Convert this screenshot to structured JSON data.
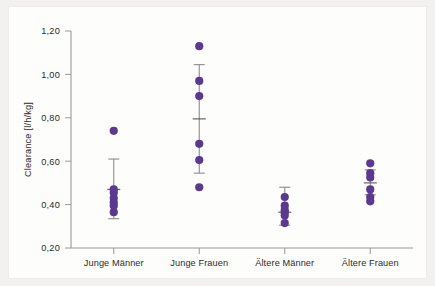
{
  "chart_data": {
    "type": "scatter",
    "title": "",
    "xlabel": "",
    "ylabel": "Clearance [l/h/kg]",
    "ylim": [
      0.2,
      1.2
    ],
    "ytick_labels": [
      "1,20",
      "1,00",
      "0,80",
      "0,60",
      "0,40",
      "0,20"
    ],
    "ytick_values": [
      1.2,
      1.0,
      0.8,
      0.6,
      0.4,
      0.2
    ],
    "grid": false,
    "legend": "none",
    "marker_color": "#5B3A8E",
    "errorbar_color": "#8c8c8c",
    "categories": [
      "Junge Männer",
      "Junge Frauen",
      "Ältere Männer",
      "Ältere Frauen"
    ],
    "groups": [
      {
        "label": "Junge Männer",
        "points": [
          0.74,
          0.47,
          0.455,
          0.43,
          0.41,
          0.395,
          0.365
        ],
        "mean": 0.47,
        "error_upper": 0.61,
        "error_lower": 0.335
      },
      {
        "label": "Junge Frauen",
        "points": [
          1.13,
          0.97,
          0.9,
          0.68,
          0.605,
          0.48
        ],
        "mean": 0.795,
        "error_upper": 1.045,
        "error_lower": 0.545
      },
      {
        "label": "Ältere Männer",
        "points": [
          0.435,
          0.395,
          0.375,
          0.365,
          0.35,
          0.315
        ],
        "mean": 0.365,
        "error_upper": 0.48,
        "error_lower": 0.305
      },
      {
        "label": "Ältere Frauen",
        "points": [
          0.59,
          0.545,
          0.525,
          0.47,
          0.435,
          0.415
        ],
        "mean": 0.5,
        "error_upper": 0.56,
        "error_lower": 0.445
      }
    ]
  },
  "axis": {
    "y_title": "Clearance [l/h/kg]",
    "y_ticks": [
      "1,20",
      "1,00",
      "0,80",
      "0,60",
      "0,40",
      "0,20"
    ],
    "x_ticks": [
      "Junge Männer",
      "Junge Frauen",
      "Ältere Männer",
      "Ältere Frauen"
    ]
  }
}
